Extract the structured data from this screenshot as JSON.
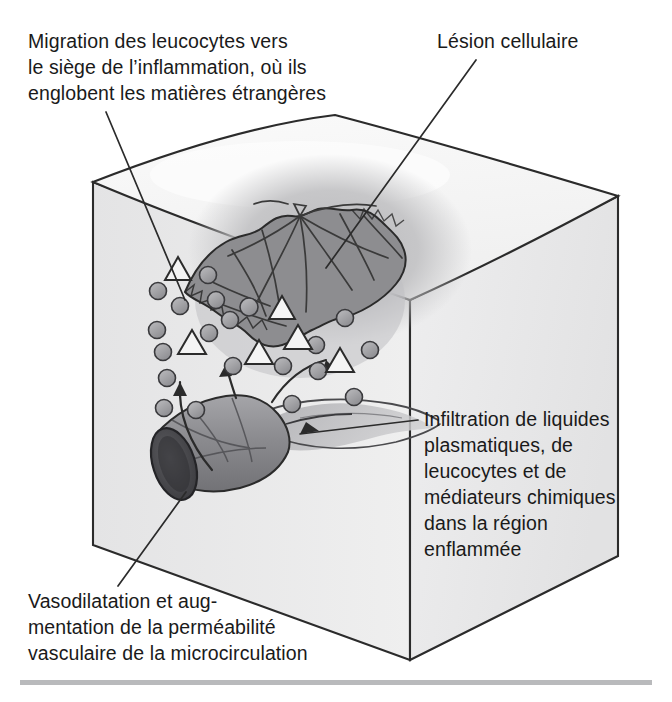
{
  "figure": {
    "type": "anatomical-illustration"
  },
  "labels": {
    "migration": {
      "text": "Migration des leucocytes vers\nle siège de l’inflammation, où ils\nenglobent les matières étrangères",
      "position": "top-left",
      "leader_target": "leukocytes-migrating"
    },
    "lesion": {
      "text": "Lésion cellulaire",
      "position": "top-right",
      "leader_target": "cellular-lesion"
    },
    "infiltration": {
      "text": "Infiltration de liquides\nplasmatiques, de\nleucocytes et de\nmédiateurs chimiques\ndans la région\nenflammée",
      "position": "right",
      "leader_target": "fluid-plume"
    },
    "vasodilatation": {
      "text": "Vasodilatation et aug-\nmentation de la perméabilité\nvasculaire de la microcirculation",
      "position": "bottom-left",
      "leader_target": "blood-vessel"
    }
  },
  "elements": {
    "tissue_block": "Bloc de tissu cubique en perspective",
    "lesion_core": "Plaie cellulaire déchiquetée au sommet du bloc",
    "lesion_halo": "Zone enflammée diffuse autour de la lésion",
    "leukocytes": "Cellules rondes grises migrant vers la lésion",
    "foreign_matter": "Triangles ouverts représentant les matières étrangères",
    "blood_vessel": "Vaisseau sanguin dilaté à lumière ouverte",
    "fluid_plume": "Panache de liquide plasmatique s'échappant du vaisseau",
    "migration_arrows": "Flèches courbes du vaisseau vers la lésion"
  },
  "colors": {
    "block_face_left": "#ececed",
    "block_face_front": "#e7e7e8",
    "block_top": "#f3f3f3",
    "lesion_core": "#8d8d90",
    "lesion_halo": "#c3c3c5",
    "leukocyte": "#9b9b9e",
    "vessel": "#8f8f93",
    "vessel_lumen": "#4a4a4d",
    "outline": "#2b2b2b",
    "text": "#1a1a1a",
    "rule": "#b9babc"
  }
}
